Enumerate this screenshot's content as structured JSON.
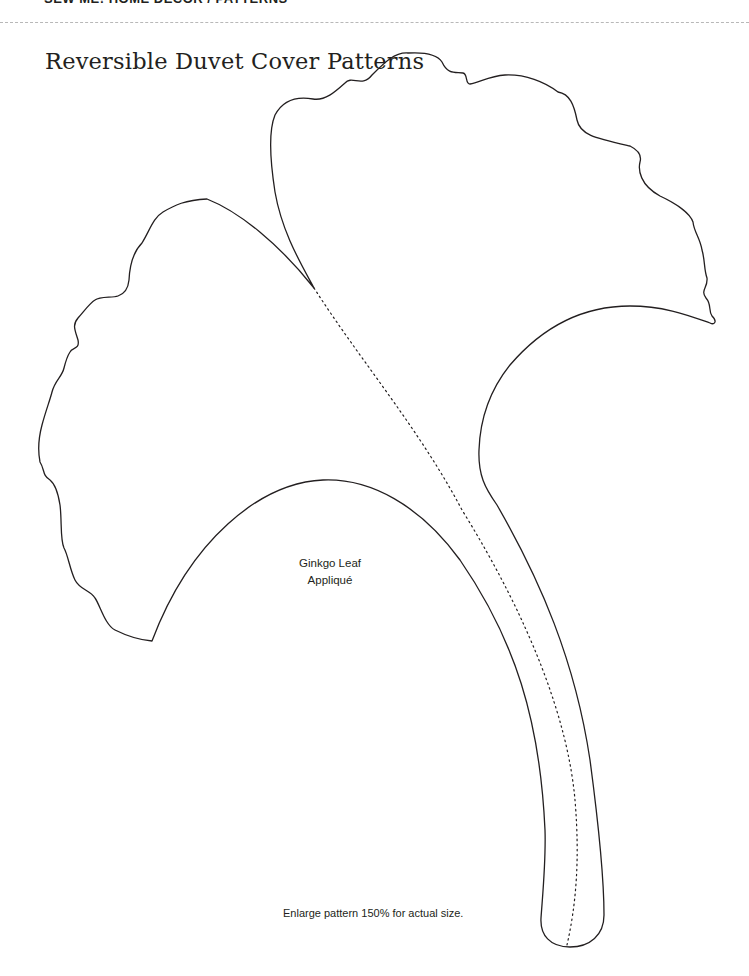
{
  "header": {
    "running_text": "SEW ME! HOME DECOR / PATTERNS"
  },
  "page": {
    "title": "Reversible Duvet Cover Patterns"
  },
  "pattern": {
    "piece_name_line1": "Ginkgo Leaf",
    "piece_name_line2": "Appliqué",
    "instruction": "Enlarge pattern 150% for actual size.",
    "outline_color": "#231f20",
    "guide_line_style": "dotted center vein",
    "rule_color": "#b8b8b8"
  }
}
